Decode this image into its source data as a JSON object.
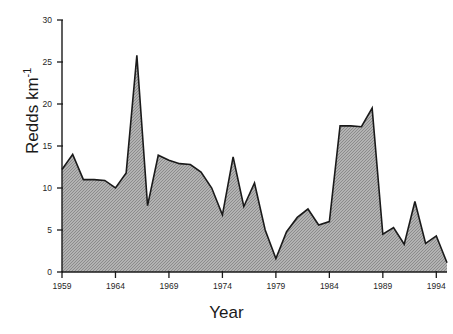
{
  "chart_data": {
    "type": "area",
    "title": "",
    "xlabel": "Year",
    "ylabel": "Redds km-1",
    "ylabel_base": "Redds km",
    "ylabel_exponent": "-1",
    "xlim": [
      1959,
      1995
    ],
    "ylim": [
      0,
      30
    ],
    "grid": false,
    "legend": null,
    "yticks": [
      0,
      5,
      10,
      15,
      20,
      25,
      30
    ],
    "ytick_labels": [
      "0",
      "5",
      "10",
      "15",
      "20",
      "25",
      "30"
    ],
    "xticks": [
      1959,
      1964,
      1969,
      1974,
      1979,
      1984,
      1989,
      1994
    ],
    "xtick_labels": [
      "1959",
      "1964",
      "1969",
      "1974",
      "1979",
      "1984",
      "1989",
      "1994"
    ],
    "x": [
      1959,
      1960,
      1961,
      1962,
      1963,
      1964,
      1965,
      1966,
      1967,
      1968,
      1969,
      1970,
      1971,
      1972,
      1973,
      1974,
      1975,
      1976,
      1977,
      1978,
      1979,
      1980,
      1981,
      1982,
      1983,
      1984,
      1985,
      1986,
      1987,
      1988,
      1989,
      1990,
      1991,
      1992,
      1993,
      1994,
      1995
    ],
    "values": [
      12.2,
      14.0,
      11.0,
      11.0,
      10.9,
      10.0,
      11.8,
      25.8,
      7.9,
      13.9,
      13.3,
      12.9,
      12.8,
      11.9,
      10.0,
      6.8,
      13.7,
      7.8,
      10.6,
      5.0,
      1.6,
      4.8,
      6.5,
      7.5,
      5.6,
      6.0,
      17.4,
      17.4,
      17.3,
      19.5,
      4.5,
      5.3,
      3.3,
      8.4,
      3.4,
      4.3,
      1.1
    ],
    "fill_color": "#a6a6a6",
    "line_color": "#1a1a1a",
    "series_name": "Redds per km"
  }
}
